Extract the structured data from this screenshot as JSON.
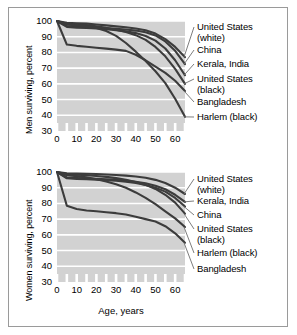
{
  "figure": {
    "background": "#ffffff",
    "border_color": "#9a9a9a",
    "plot_background": "#d2d2d2",
    "gridline_color": "#ffffff",
    "line_color": "#3c3c3c",
    "leader_color": "#6e6e6e"
  },
  "chart_data": [
    {
      "type": "line",
      "title": "",
      "panel": "men",
      "xlabel": "",
      "ylabel": "Men surviving, percent",
      "xlim": [
        0,
        65
      ],
      "ylim": [
        30,
        100
      ],
      "xticks": [
        0,
        10,
        20,
        30,
        40,
        50,
        60
      ],
      "yticks": [
        30,
        40,
        50,
        60,
        70,
        80,
        90,
        100
      ],
      "xtick_labels": [
        "0",
        "10",
        "20",
        "30",
        "40",
        "50",
        "60"
      ],
      "ytick_labels": [
        "30",
        "40",
        "50",
        "60",
        "70",
        "80",
        "90",
        "100"
      ],
      "minor_xtick_step": 5,
      "grid": "horizontal",
      "legend_position": "right-leader-lines",
      "x": [
        0,
        5,
        10,
        15,
        20,
        25,
        30,
        35,
        40,
        45,
        50,
        55,
        60,
        65
      ],
      "series": [
        {
          "name": "United States (white)",
          "label_lines": [
            "United States",
            "(white)"
          ],
          "values": [
            100,
            98.9,
            98.6,
            98.3,
            97.8,
            97.2,
            96.6,
            96.0,
            95.2,
            94.1,
            92.0,
            88.5,
            83.5,
            77.0
          ]
        },
        {
          "name": "China",
          "label_lines": [
            "China"
          ],
          "values": [
            100,
            96.8,
            96.4,
            96.2,
            95.9,
            95.5,
            95.1,
            94.6,
            93.9,
            92.8,
            90.8,
            87.0,
            81.0,
            72.5
          ]
        },
        {
          "name": "Kerala, India",
          "label_lines": [
            "Kerala, India"
          ],
          "values": [
            100,
            96.2,
            95.8,
            95.5,
            95.2,
            94.8,
            94.2,
            93.4,
            92.3,
            90.5,
            87.5,
            82.5,
            75.0,
            65.5
          ]
        },
        {
          "name": "United States (black)",
          "label_lines": [
            "United States",
            "(black)"
          ],
          "values": [
            100,
            98.2,
            97.8,
            97.4,
            96.6,
            95.6,
            94.4,
            93.0,
            91.0,
            88.0,
            83.5,
            77.5,
            69.5,
            60.0
          ]
        },
        {
          "name": "Bangladesh",
          "label_lines": [
            "Bangladesh"
          ],
          "values": [
            100,
            85.0,
            84.2,
            83.6,
            83.0,
            82.4,
            81.8,
            81.0,
            78.5,
            75.0,
            71.0,
            67.0,
            62.0,
            55.5
          ]
        },
        {
          "name": "Harlem (black)",
          "label_lines": [
            "Harlem (black)"
          ],
          "values": [
            100,
            97.8,
            97.2,
            96.6,
            95.6,
            93.6,
            90.5,
            86.0,
            80.5,
            74.5,
            68.0,
            60.5,
            50.5,
            39.0
          ]
        }
      ]
    },
    {
      "type": "line",
      "title": "",
      "panel": "women",
      "xlabel": "Age, years",
      "ylabel": "Women surviving, percent",
      "xlim": [
        0,
        65
      ],
      "ylim": [
        30,
        100
      ],
      "xticks": [
        0,
        10,
        20,
        30,
        40,
        50,
        60
      ],
      "yticks": [
        30,
        40,
        50,
        60,
        70,
        80,
        90,
        100
      ],
      "xtick_labels": [
        "0",
        "10",
        "20",
        "30",
        "40",
        "50",
        "60"
      ],
      "ytick_labels": [
        "30",
        "40",
        "50",
        "60",
        "70",
        "80",
        "90",
        "100"
      ],
      "minor_xtick_step": 5,
      "grid": "horizontal",
      "legend_position": "right-leader-lines",
      "x": [
        0,
        5,
        10,
        15,
        20,
        25,
        30,
        35,
        40,
        45,
        50,
        55,
        60,
        65
      ],
      "series": [
        {
          "name": "United States (white)",
          "label_lines": [
            "United States",
            "(white)"
          ],
          "values": [
            100,
            99.2,
            99.0,
            98.9,
            98.7,
            98.4,
            98.1,
            97.7,
            97.1,
            96.3,
            95.0,
            93.0,
            90.0,
            86.0
          ]
        },
        {
          "name": "Kerala, India",
          "label_lines": [
            "Kerala, India"
          ],
          "values": [
            100,
            96.5,
            96.2,
            96.0,
            95.7,
            95.4,
            95.0,
            94.5,
            93.8,
            92.8,
            91.3,
            89.0,
            85.5,
            81.0
          ]
        },
        {
          "name": "China",
          "label_lines": [
            "China"
          ],
          "values": [
            100,
            96.0,
            95.6,
            95.4,
            95.1,
            94.8,
            94.4,
            93.8,
            93.0,
            91.8,
            90.0,
            87.5,
            83.5,
            78.0
          ]
        },
        {
          "name": "United States (black)",
          "label_lines": [
            "United States",
            "(black)"
          ],
          "values": [
            100,
            98.6,
            98.3,
            98.0,
            97.5,
            96.9,
            96.1,
            95.1,
            93.7,
            91.8,
            89.2,
            85.5,
            80.5,
            73.5
          ]
        },
        {
          "name": "Harlem (black)",
          "label_lines": [
            "Harlem (black)"
          ],
          "values": [
            100,
            98.0,
            97.4,
            96.6,
            95.4,
            94.0,
            92.2,
            90.0,
            87.0,
            83.5,
            79.5,
            75.0,
            70.5,
            65.0
          ]
        },
        {
          "name": "Bangladesh",
          "label_lines": [
            "Bangladesh"
          ],
          "values": [
            100,
            78.5,
            76.5,
            75.5,
            75.0,
            74.4,
            73.8,
            73.0,
            71.5,
            70.0,
            68.5,
            65.5,
            61.0,
            55.0
          ]
        }
      ]
    }
  ],
  "labels": {
    "men_axis": "Men surviving, percent",
    "women_axis": "Women surviving, percent",
    "age_axis": "Age, years"
  }
}
